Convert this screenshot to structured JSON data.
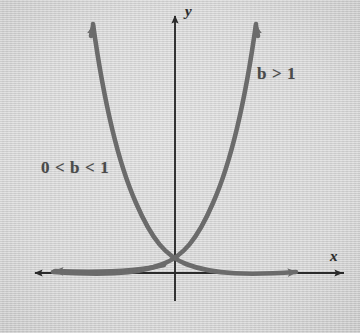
{
  "figure": {
    "kind": "coordinate-plane-graph",
    "background_color": "#d4d4d4",
    "curve_color": "#6b6b6b",
    "axis_color": "#2a2a2a",
    "label_color": "#4a4a4a"
  },
  "axes": {
    "x_label": "x",
    "y_label": "y",
    "origin": {
      "x": 175,
      "y": 273
    },
    "x_axis": {
      "start_x": 33,
      "end_x": 344,
      "y": 273
    },
    "y_axis": {
      "x": 175,
      "start_y": 14,
      "end_y": 301
    }
  },
  "curves": [
    {
      "id": "growth",
      "label": "b > 1",
      "label_parts": {
        "base": "b",
        "relation": ">",
        "value": "1"
      },
      "description": "increasing exponential curve rising to the right",
      "color": "#6b6b6b",
      "arrow_tip": {
        "x": 255,
        "y": 20
      }
    },
    {
      "id": "decay",
      "label": "0 < b < 1",
      "label_parts": {
        "lower": "0",
        "relation_left": "<",
        "base": "b",
        "relation_right": "<",
        "upper": "1"
      },
      "description": "decreasing exponential curve falling to the right",
      "color": "#6b6b6b",
      "arrow_tip": {
        "x": 92,
        "y": 20
      }
    }
  ],
  "chart_data": {
    "type": "line",
    "title": "",
    "xlabel": "x",
    "ylabel": "y",
    "grid": false,
    "legend": "inline-annotations",
    "xlim": [
      -3.5,
      3.5
    ],
    "ylim": [
      -0.6,
      6.2
    ],
    "annotations": [
      {
        "text": "b > 1",
        "x": 2.0,
        "y": 4.7
      },
      {
        "text": "0 < b < 1",
        "x": -2.4,
        "y": 2.6
      }
    ],
    "series": [
      {
        "name": "b > 1",
        "equation": "y = b^x, b > 1",
        "x": [
          -3.0,
          -2.5,
          -2.0,
          -1.5,
          -1.0,
          -0.5,
          0.0,
          0.5,
          1.0,
          1.5,
          2.0,
          2.5,
          2.75
        ],
        "values": [
          0.06,
          0.1,
          0.17,
          0.28,
          0.45,
          0.72,
          1.0,
          1.45,
          2.1,
          2.95,
          4.0,
          5.2,
          5.9
        ]
      },
      {
        "name": "0 < b < 1",
        "equation": "y = b^x, 0 < b < 1",
        "x": [
          -2.75,
          -2.5,
          -2.0,
          -1.5,
          -1.0,
          -0.5,
          0.0,
          0.5,
          1.0,
          1.5,
          2.0,
          2.5,
          3.0
        ],
        "values": [
          5.9,
          5.2,
          4.0,
          2.95,
          2.1,
          1.45,
          1.0,
          0.72,
          0.45,
          0.28,
          0.17,
          0.1,
          0.06
        ]
      }
    ],
    "intersection": {
      "x": 0,
      "y": 1,
      "note": "both curves pass through (0, 1)"
    }
  }
}
